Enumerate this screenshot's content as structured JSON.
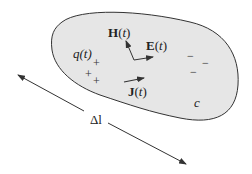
{
  "diagram": {
    "region_label": "c",
    "charge_label": "q(t)",
    "fields": {
      "H": {
        "symbol": "H",
        "arg": "(",
        "t": "t",
        "close": ")"
      },
      "E": {
        "symbol": "E",
        "arg": "(",
        "t": "t",
        "close": ")"
      },
      "J": {
        "symbol": "J",
        "arg": "(",
        "t": "t",
        "close": ")"
      }
    },
    "dimension_label": "Δl",
    "plus_signs": [
      "+",
      "+",
      "+"
    ],
    "minus_signs": [
      "−",
      "−",
      "−"
    ],
    "colors": {
      "region_fill": "#e6e6e6",
      "stroke": "#333333"
    }
  }
}
